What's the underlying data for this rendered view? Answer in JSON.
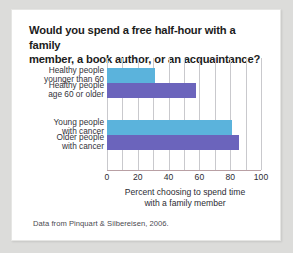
{
  "card": {
    "title_line1": "Would you spend a free half-hour with a family",
    "title_line2": "member, a book author, or an acquaintance?",
    "source_note": "Data from Pinquart & Silbereisen, 2006."
  },
  "chart_data": {
    "type": "bar",
    "orientation": "horizontal",
    "title": "Would you spend a free half-hour with a family member, a book author, or an acquaintance?",
    "categories": [
      "Healthy people younger than 60",
      "Healthy people age 60 or older",
      "Young people with cancer",
      "Older people with cancer"
    ],
    "category_lines": [
      [
        "Healthy people",
        "younger than 60"
      ],
      [
        "Healthy people",
        "age 60 or older"
      ],
      [
        "Young people",
        "with cancer"
      ],
      [
        "Older people",
        "with cancer"
      ]
    ],
    "values": [
      31,
      58,
      81,
      86
    ],
    "bar_colors": [
      "#5bb3dc",
      "#6b64bc",
      "#5bb3dc",
      "#6b64bc"
    ],
    "xlabel_line1": "Percent choosing to spend time",
    "xlabel_line2": "with a family member",
    "ylabel": "",
    "xlim": [
      0,
      100
    ],
    "xticks": [
      0,
      20,
      40,
      60,
      80,
      100
    ],
    "xtick_labels": [
      "0",
      "20",
      "40",
      "60",
      "80",
      "100"
    ],
    "minor_gridlines": [
      10,
      30,
      50,
      70,
      90
    ],
    "grid": true,
    "legend": "none"
  }
}
